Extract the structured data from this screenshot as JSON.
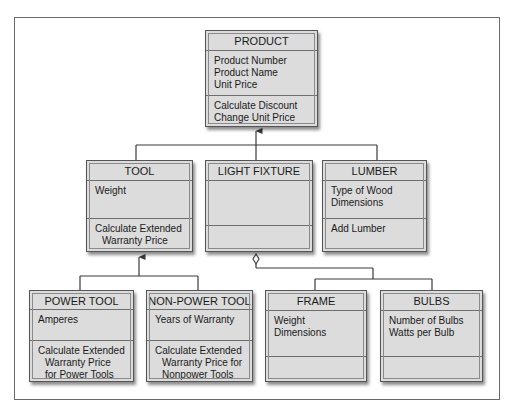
{
  "diagram": {
    "type": "UML class hierarchy",
    "classes": {
      "product": {
        "name": "PRODUCT",
        "attributes": [
          "Product Number",
          "Product Name",
          "Unit Price"
        ],
        "methods": [
          "Calculate Discount",
          "Change Unit Price"
        ]
      },
      "tool": {
        "name": "TOOL",
        "attributes": [
          "Weight"
        ],
        "methods": [
          "Calculate Extended",
          "Warranty Price"
        ]
      },
      "light_fixture": {
        "name": "LIGHT FIXTURE",
        "attributes": [],
        "methods": []
      },
      "lumber": {
        "name": "LUMBER",
        "attributes": [
          "Type of Wood",
          "Dimensions"
        ],
        "methods": [
          "Add Lumber"
        ]
      },
      "power_tool": {
        "name": "POWER TOOL",
        "attributes": [
          "Amperes"
        ],
        "methods": [
          "Calculate Extended",
          "Warranty Price",
          "for Power Tools"
        ]
      },
      "non_power_tool": {
        "name": "NON-POWER TOOL",
        "attributes": [
          "Years of Warranty"
        ],
        "methods": [
          "Calculate Extended",
          "Warranty Price for",
          "Nonpower Tools"
        ]
      },
      "frame": {
        "name": "FRAME",
        "attributes": [
          "Weight",
          "Dimensions"
        ],
        "methods": []
      },
      "bulbs": {
        "name": "BULBS",
        "attributes": [
          "Number of Bulbs",
          "Watts per Bulb"
        ],
        "methods": []
      }
    },
    "relationships": [
      {
        "type": "generalization",
        "parent": "PRODUCT",
        "children": [
          "TOOL",
          "LIGHT FIXTURE",
          "LUMBER"
        ]
      },
      {
        "type": "generalization",
        "parent": "TOOL",
        "children": [
          "POWER TOOL",
          "NON-POWER TOOL"
        ]
      },
      {
        "type": "aggregation",
        "whole": "LIGHT FIXTURE",
        "parts": [
          "FRAME",
          "BULBS"
        ]
      }
    ]
  },
  "colors": {
    "box_fill": "#dcdcdc",
    "box_border": "#555555",
    "line": "#3a3a3a",
    "frame_border": "#6a6a6a"
  }
}
